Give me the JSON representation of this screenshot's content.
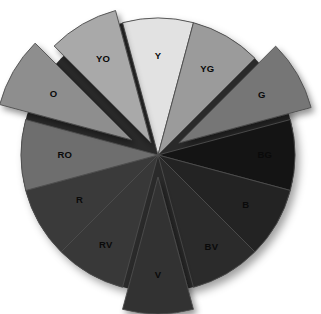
{
  "figure": {
    "background_color": "#ffffff",
    "center_x": 158,
    "center_y": 155,
    "radius": 137,
    "stroke_color": "#4d4d4d",
    "label_color": "#0a0a0a"
  },
  "chart_data": {
    "type": "pie",
    "xlabel": "",
    "ylabel": "",
    "legend_position": "none",
    "grid": false,
    "categories": [
      "Y",
      "YG",
      "G",
      "BG",
      "B",
      "BV",
      "V",
      "RV",
      "R",
      "RO",
      "O",
      "YO"
    ],
    "values": [
      30,
      30,
      30,
      30,
      30,
      30,
      30,
      30,
      30,
      30,
      30,
      30
    ],
    "slice_angle_degrees": 30,
    "slices": [
      {
        "label": "Y",
        "name": "yellow",
        "color": "#e2e2e2",
        "start_angle": -15,
        "end_angle": 15,
        "explode": 0,
        "radius": 137,
        "label_radius": 0.72
      },
      {
        "label": "YG",
        "name": "yellow-green",
        "color": "#9b9b9b",
        "start_angle": 15,
        "end_angle": 45,
        "explode": 0,
        "radius": 137,
        "label_radius": 0.72
      },
      {
        "label": "G",
        "name": "green",
        "color": "#767676",
        "start_angle": 45,
        "end_angle": 75,
        "explode": 24,
        "radius": 137,
        "label_radius": 0.7
      },
      {
        "label": "BG",
        "name": "blue-green",
        "color": "#141414",
        "start_angle": 75,
        "end_angle": 105,
        "explode": 0,
        "radius": 137,
        "label_radius": 0.78
      },
      {
        "label": "B",
        "name": "blue",
        "color": "#232323",
        "start_angle": 105,
        "end_angle": 135,
        "explode": 0,
        "radius": 137,
        "label_radius": 0.74
      },
      {
        "label": "BV",
        "name": "blue-violet",
        "color": "#2b2b2b",
        "start_angle": 135,
        "end_angle": 165,
        "explode": 0,
        "radius": 137,
        "label_radius": 0.78
      },
      {
        "label": "V",
        "name": "violet",
        "color": "#323232",
        "start_angle": 165,
        "end_angle": 195,
        "explode": 22,
        "radius": 137,
        "label_radius": 0.72
      },
      {
        "label": "RV",
        "name": "red-violet",
        "color": "#383838",
        "start_angle": 195,
        "end_angle": 225,
        "explode": 0,
        "radius": 137,
        "label_radius": 0.76
      },
      {
        "label": "R",
        "name": "red",
        "color": "#3a3a3a",
        "start_angle": 225,
        "end_angle": 255,
        "explode": 0,
        "radius": 137,
        "label_radius": 0.66
      },
      {
        "label": "RO",
        "name": "red-orange",
        "color": "#6e6e6e",
        "start_angle": 255,
        "end_angle": 285,
        "explode": 0,
        "radius": 137,
        "label_radius": 0.68
      },
      {
        "label": "O",
        "name": "orange",
        "color": "#8e8e8e",
        "start_angle": 285,
        "end_angle": 315,
        "explode": 30,
        "radius": 137,
        "label_radius": 0.66
      },
      {
        "label": "YO",
        "name": "yellow-orange",
        "color": "#a9a9a9",
        "start_angle": 315,
        "end_angle": 345,
        "explode": 14,
        "radius": 137,
        "label_radius": 0.7
      }
    ]
  }
}
